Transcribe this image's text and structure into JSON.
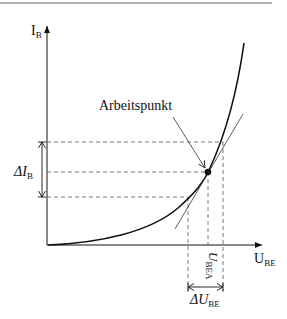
{
  "diagram": {
    "axes": {
      "y_label_main": "I",
      "y_label_sub": "B",
      "x_label_main": "U",
      "x_label_sub": "BE"
    },
    "annotations": {
      "operating_point": "Arbeitspunkt",
      "delta_ib_main": "ΔI",
      "delta_ib_sub": "B",
      "ubea_main": "U",
      "ubea_sub": "BEA",
      "delta_ube_main": "ΔU",
      "delta_ube_sub": "BE"
    },
    "colors": {
      "stroke": "#111111",
      "dashed": "#555555",
      "top_rule": "#9a9a9a",
      "background": "#ffffff"
    }
  }
}
